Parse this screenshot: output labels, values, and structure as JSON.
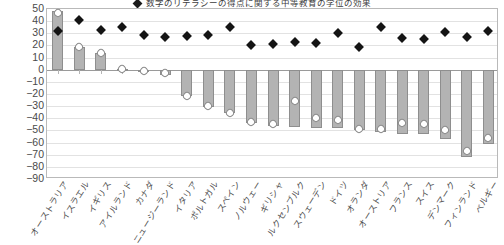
{
  "legend": {
    "marker_icon": "black-diamond-marker",
    "label": "数字のリテラシーの得点に関する中等教育の学位の効果"
  },
  "chart_data": {
    "type": "bar",
    "title": "数字のリテラシーの得点に関する中等教育の学位の効果",
    "xlabel": "",
    "ylabel": "",
    "ylim": [
      -90,
      50
    ],
    "ytick_step": 10,
    "grid": true,
    "legend_position": "top-center",
    "yticks": [
      "50",
      "40",
      "30",
      "20",
      "10",
      "0",
      "-10",
      "-20",
      "-30",
      "-40",
      "-50",
      "-60",
      "-70",
      "-80",
      "-90"
    ],
    "categories": [
      "オーストラリア",
      "イスラエル",
      "イギリス",
      "アイルランド",
      "カナダ",
      "ニュージーランド",
      "イタリア",
      "ポルトガル",
      "スペイン",
      "ノルウェー",
      "ギリシャ",
      "ルクセンブルク",
      "スウェーデン",
      "ドイツ",
      "オランダ",
      "オーストリア",
      "フランス",
      "スイス",
      "デンマーク",
      "フィンランド",
      "ベルギー"
    ],
    "series": [
      {
        "name": "bars",
        "type": "bar",
        "color": "#b3b3b3",
        "values": [
          48,
          19,
          14,
          1,
          -1,
          -4,
          -22,
          -31,
          -36,
          -44,
          -46,
          -47,
          -48,
          -48,
          -50,
          -51,
          -53,
          -53,
          -57,
          -72,
          -61
        ]
      },
      {
        "name": "black-diamond",
        "type": "scatter",
        "color": "#141414",
        "values": [
          32,
          41,
          33,
          35,
          29,
          27,
          28,
          29,
          35,
          20,
          21,
          23,
          22,
          30,
          19,
          35,
          26,
          25,
          31,
          27,
          32
        ]
      },
      {
        "name": "hollow-diamond",
        "type": "scatter",
        "color": "#ffffff",
        "values": [
          47,
          19,
          14,
          1,
          -1,
          -3,
          -22,
          -30,
          -36,
          -43,
          -45,
          -26,
          -40,
          -41,
          -49,
          -49,
          -44,
          -45,
          -50,
          -67,
          -56
        ]
      }
    ]
  }
}
